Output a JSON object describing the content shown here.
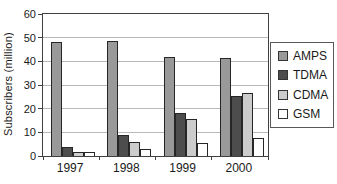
{
  "chart_data": {
    "type": "bar",
    "title": "",
    "xlabel": "",
    "ylabel": "Subscribers (million)",
    "categories": [
      "1997",
      "1998",
      "1999",
      "2000"
    ],
    "series": [
      {
        "name": "AMPS",
        "color": "#999999",
        "values": [
          48,
          48.5,
          42,
          41.5
        ]
      },
      {
        "name": "TDMA",
        "color": "#4d4d4d",
        "values": [
          4,
          9,
          18,
          25.5
        ]
      },
      {
        "name": "CDMA",
        "color": "#cccccc",
        "values": [
          1.5,
          6,
          15.5,
          26.5
        ]
      },
      {
        "name": "GSM",
        "color": "#ffffff",
        "values": [
          1.5,
          3,
          5.5,
          7.5
        ]
      }
    ],
    "ylim": [
      0,
      60
    ],
    "yticks": [
      0,
      10,
      20,
      30,
      40,
      50,
      60
    ],
    "grid": true,
    "legend_position": "right",
    "colors": {
      "axis": "#404040",
      "gridline": "#b8b8b8",
      "text": "#1a1a1a"
    }
  }
}
